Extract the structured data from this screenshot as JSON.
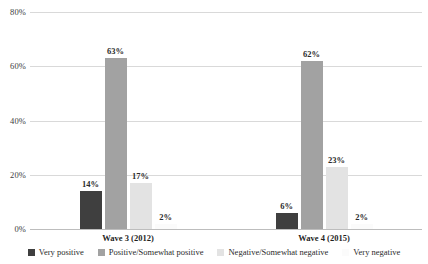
{
  "chart_data": {
    "type": "bar",
    "title": "",
    "subtitle": "",
    "xlabel": "",
    "ylabel": "",
    "grid": true,
    "legend_position": "bottom",
    "categories": [
      "Wave 3 (2012)",
      "Wave 4 (2015)"
    ],
    "ylim": [
      0,
      80
    ],
    "y_ticks": [
      0,
      20,
      40,
      60,
      80
    ],
    "y_tick_labels": [
      "0%",
      "20%",
      "40%",
      "60%",
      "80%"
    ],
    "series": [
      {
        "name": "Very positive",
        "color": "#3f3f3f",
        "values": [
          14,
          6
        ],
        "value_labels": [
          "14%",
          "6%"
        ]
      },
      {
        "name": "Positive/Somewhat positive",
        "color": "#a2a2a2",
        "values": [
          63,
          62
        ],
        "value_labels": [
          "63%",
          "62%"
        ]
      },
      {
        "name": "Negative/Somewhat negative",
        "color": "#e3e3e3",
        "values": [
          17,
          23
        ],
        "value_labels": [
          "17%",
          "23%"
        ]
      },
      {
        "name": "Very negative",
        "color": "#fbfbfb",
        "values": [
          2,
          2
        ],
        "value_labels": [
          "2%",
          "2%"
        ]
      }
    ]
  },
  "axis": {
    "gridline_color": "#d9d9d9",
    "zero_line_color": "#bdbdbd"
  }
}
